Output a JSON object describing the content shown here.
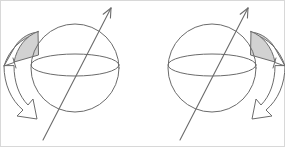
{
  "figure": {
    "width": 285,
    "height": 147,
    "background": "#ffffff",
    "line_color": "#6b6b6b",
    "shade_color": "#d2d2d2",
    "frame_color": "#d8d8d8",
    "caption": ""
  },
  "panels": [
    {
      "id": "left-panel",
      "name": "sphere-with-left-rotation-arrow",
      "sphere": {
        "cx": 75,
        "cy": 68,
        "r": 44,
        "equator_rx": 44,
        "equator_ry": 11,
        "equator_cy": 65
      },
      "axis": {
        "label": "rotation-axis",
        "x1": 43,
        "y1": 140,
        "x2": 111,
        "y2": 8,
        "arrowhead": "top"
      },
      "rotation_arrow": {
        "side": "left",
        "direction": "counterclockwise",
        "shaded_lobe": true
      }
    },
    {
      "id": "right-panel",
      "name": "sphere-with-right-rotation-arrow",
      "sphere": {
        "cx": 212,
        "cy": 68,
        "r": 44,
        "equator_rx": 44,
        "equator_ry": 11,
        "equator_cy": 65
      },
      "axis": {
        "label": "rotation-axis",
        "x1": 180,
        "y1": 140,
        "x2": 248,
        "y2": 8,
        "arrowhead": "top"
      },
      "rotation_arrow": {
        "side": "right",
        "direction": "clockwise",
        "shaded_lobe": true
      }
    }
  ]
}
